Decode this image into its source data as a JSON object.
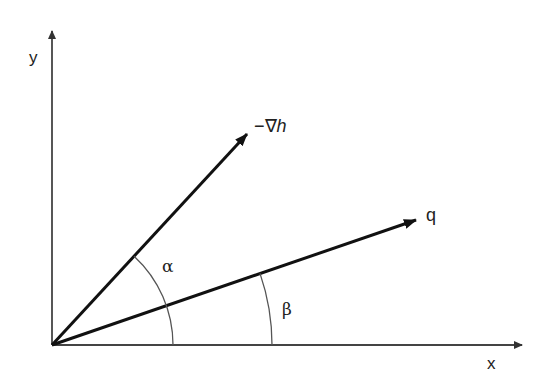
{
  "diagram": {
    "axes": {
      "x_label": "x",
      "y_label": "y",
      "origin": [
        52,
        345
      ],
      "x_end": [
        524,
        345
      ],
      "y_end": [
        52,
        29
      ]
    },
    "vectors": [
      {
        "name": "negative-gradient-h",
        "label_prefix": "−∇",
        "label_var": "h",
        "start": [
          52,
          345
        ],
        "end": [
          249,
          132
        ]
      },
      {
        "name": "q",
        "label": "q",
        "start": [
          52,
          345
        ],
        "end": [
          418,
          219
        ]
      }
    ],
    "angles": [
      {
        "name": "alpha",
        "label": "α",
        "between": [
          "−∇h",
          "x-axis"
        ],
        "radius": 121
      },
      {
        "name": "beta",
        "label": "β",
        "between": [
          "q",
          "x-axis"
        ],
        "radius": 220
      }
    ],
    "colors": {
      "line": "#1a1a1a",
      "axis": "#444444",
      "arc": "#555555",
      "text": "#222222"
    }
  }
}
